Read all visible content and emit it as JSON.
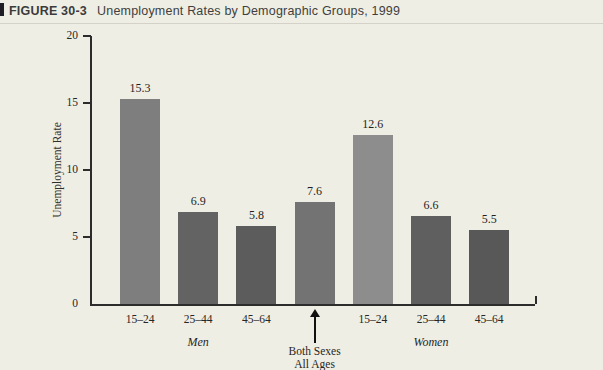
{
  "header": {
    "figure_label": "FIGURE 30-3",
    "title": "Unemployment Rates by Demographic Groups, 1999"
  },
  "chart_data": {
    "type": "bar",
    "title": "Unemployment Rates by Demographic Groups, 1999",
    "xlabel": "",
    "ylabel": "Unemployment Rate",
    "ylim": [
      0,
      20
    ],
    "yticks": [
      0,
      5,
      10,
      15,
      20
    ],
    "grid": false,
    "legend": false,
    "categories": [
      "15–24",
      "25–44",
      "45–64",
      "",
      "15–24",
      "25–44",
      "45–64"
    ],
    "values": [
      15.3,
      6.9,
      5.8,
      7.6,
      12.6,
      6.6,
      5.5
    ],
    "value_labels": [
      "15.3",
      "6.9",
      "5.8",
      "7.6",
      "12.6",
      "6.6",
      "5.5"
    ],
    "bar_colors": [
      "#7e7e7e",
      "#636363",
      "#5c5c5c",
      "#737373",
      "#8d8d8d",
      "#5f5f5f",
      "#585858"
    ],
    "group_labels": [
      {
        "label": "Men",
        "bar_index": 1
      },
      {
        "label": "Women",
        "bar_index": 5
      }
    ],
    "annotation": {
      "lines": [
        "Both Sexes",
        "All Ages"
      ],
      "bar_index": 3
    }
  },
  "colors": {
    "background": "#efeee4",
    "axis": "#2c2c2c",
    "corner_square": "#1d1d26"
  }
}
